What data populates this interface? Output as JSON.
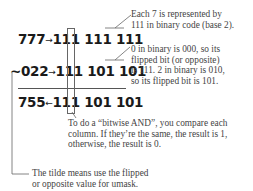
{
  "rows": [
    {
      "octal": "777",
      "arrow": "→",
      "binary": [
        "111",
        "111",
        "111"
      ]
    },
    {
      "octal": "~022",
      "arrow": "→",
      "binary": [
        "111",
        "101",
        "101"
      ]
    },
    {
      "octal": "755",
      "arrow": "←",
      "binary": [
        "111",
        "101",
        "101"
      ]
    }
  ],
  "notes": {
    "each_seven": [
      "Each 7 is represented by",
      "111 in binary code (base 2)."
    ],
    "zero_binary": [
      "0 in binary is 000, so its",
      "flipped bit (or opposite)",
      "is 111. 2 in binary is 010,",
      "so its flipped bit is 101."
    ],
    "bitwise_and": [
      "To do a “bitwise AND”, you compare each",
      "column. If they’re the same, the result is 1,",
      "otherwise, the result is 0."
    ],
    "tilde": [
      "The tilde means use the flipped",
      "or opposite value for umask."
    ]
  }
}
